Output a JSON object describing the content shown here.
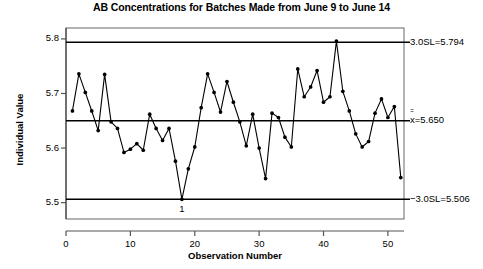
{
  "chart_data": {
    "type": "line",
    "subtype": "individuals-control-chart",
    "title": "AB Concentrations for Batches Made from June 9 to June 14",
    "xlabel": "Observation Number",
    "ylabel": "Individual Value",
    "xlim": [
      0,
      52.5
    ],
    "ylim": [
      5.47,
      5.82
    ],
    "grid": false,
    "legend": "none",
    "xticks": [
      "0",
      "10",
      "20",
      "30",
      "40",
      "50"
    ],
    "xtick_values": [
      0,
      10,
      20,
      30,
      40,
      50
    ],
    "yticks": [
      "5.5",
      "5.6",
      "5.7",
      "5.8"
    ],
    "ytick_values": [
      5.5,
      5.6,
      5.7,
      5.8
    ],
    "control_limits": [
      {
        "name": "upper-control-limit",
        "label": "3.0SL=5.794",
        "value": 5.794
      },
      {
        "name": "center-line",
        "label_prefix": "x",
        "label_suffix": "=5.650",
        "value": 5.65
      },
      {
        "name": "lower-control-limit",
        "label": "−3.0SL=5.506",
        "value": 5.506
      }
    ],
    "annotations": [
      {
        "label": "1",
        "x": 18,
        "y": 5.506,
        "note": "out-of-control point below lower control limit"
      }
    ],
    "x": [
      1,
      2,
      3,
      4,
      5,
      6,
      7,
      8,
      9,
      10,
      11,
      12,
      13,
      14,
      15,
      16,
      17,
      18,
      19,
      20,
      21,
      22,
      23,
      24,
      25,
      26,
      27,
      28,
      29,
      30,
      31,
      32,
      33,
      34,
      35,
      36,
      37,
      38,
      39,
      40,
      41,
      42,
      43,
      44,
      45,
      46,
      47,
      48,
      49,
      50,
      51,
      52
    ],
    "values": [
      5.668,
      5.736,
      5.702,
      5.668,
      5.632,
      5.735,
      5.648,
      5.636,
      5.592,
      5.598,
      5.608,
      5.596,
      5.662,
      5.636,
      5.614,
      5.636,
      5.576,
      5.506,
      5.562,
      5.602,
      5.674,
      5.736,
      5.702,
      5.666,
      5.722,
      5.684,
      5.648,
      5.604,
      5.662,
      5.6,
      5.544,
      5.664,
      5.656,
      5.62,
      5.602,
      5.745,
      5.694,
      5.712,
      5.742,
      5.684,
      5.694,
      5.796,
      5.704,
      5.668,
      5.626,
      5.602,
      5.612,
      5.664,
      5.69,
      5.656,
      5.676,
      5.546
    ],
    "marker": "filled-circle",
    "line_color": "#000000",
    "limit_line_color": "#000000"
  }
}
